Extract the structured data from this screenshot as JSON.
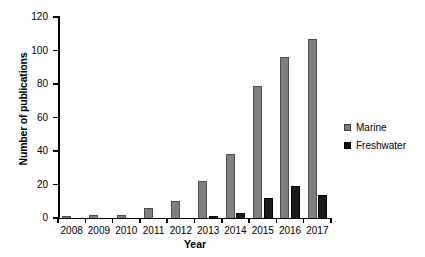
{
  "chart_data": {
    "type": "bar",
    "title": "",
    "xlabel": "Year",
    "ylabel": "Number of publications",
    "categories": [
      "2008",
      "2009",
      "2010",
      "2011",
      "2012",
      "2013",
      "2014",
      "2015",
      "2016",
      "2017"
    ],
    "series": [
      {
        "name": "Marine",
        "color": "#808080",
        "values": [
          1,
          2,
          2,
          6,
          10,
          22,
          38,
          79,
          96,
          107
        ]
      },
      {
        "name": "Freshwater",
        "color": "#1a1a1a",
        "values": [
          0,
          0,
          0,
          0,
          0,
          1,
          3,
          12,
          19,
          14
        ]
      }
    ],
    "ylim": [
      0,
      120
    ],
    "yticks": [
      0,
      20,
      40,
      60,
      80,
      100,
      120
    ],
    "ytick_labels": [
      "0",
      "20",
      "40",
      "60",
      "80",
      "100",
      "120"
    ],
    "grid": false,
    "legend_position": "right"
  },
  "legend": {
    "items": [
      {
        "label": "Marine",
        "swatch": "gray-square-swatch"
      },
      {
        "label": "Freshwater",
        "swatch": "black-square-swatch"
      }
    ]
  }
}
